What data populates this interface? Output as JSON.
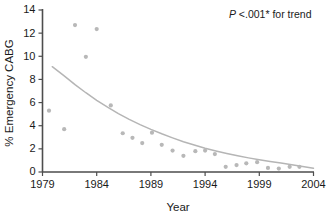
{
  "chart_data": {
    "type": "scatter",
    "title": "",
    "xlabel": "Year",
    "ylabel": "% Emergency CABG",
    "xlim": [
      1979,
      2004
    ],
    "ylim": [
      0,
      14
    ],
    "xticks": [
      1979,
      1984,
      1989,
      1994,
      1999,
      2004
    ],
    "yticks": [
      0,
      2,
      4,
      6,
      8,
      10,
      12,
      14
    ],
    "grid": false,
    "legend": null,
    "annotations": [
      {
        "name": "p-value-trend",
        "text_italic": "P",
        "text": " <.001* for trend",
        "x": 1996.2,
        "y": 13.3
      }
    ],
    "series": [
      {
        "name": "Emergency CABG rate",
        "marker": "circle",
        "color": "#b8b8b8",
        "x": [
          1979.6,
          1981.0,
          1982.0,
          1983.0,
          1984.0,
          1985.3,
          1986.4,
          1987.3,
          1988.2,
          1989.1,
          1990.0,
          1991.0,
          1992.0,
          1993.1,
          1994.0,
          1994.9,
          1995.9,
          1996.9,
          1997.8,
          1998.8,
          1999.8,
          2000.8,
          2001.8,
          2002.7
        ],
        "y": [
          5.3,
          3.7,
          12.7,
          9.95,
          12.35,
          5.75,
          3.35,
          2.95,
          2.5,
          3.4,
          2.35,
          1.85,
          1.4,
          1.8,
          1.85,
          1.55,
          0.45,
          0.6,
          0.75,
          0.85,
          0.35,
          0.3,
          0.45,
          0.45
        ]
      }
    ],
    "trend": {
      "name": "fitted exponential decline",
      "color": "#b5b5b5",
      "x": [
        1979.9,
        1981.0,
        1982.0,
        1983.0,
        1984.0,
        1985.0,
        1986.0,
        1987.0,
        1988.0,
        1989.0,
        1990.0,
        1991.0,
        1992.0,
        1993.0,
        1994.0,
        1995.0,
        1996.0,
        1997.0,
        1998.0,
        1999.0,
        2000.0,
        2001.0,
        2002.0,
        2003.0,
        2004.0
      ],
      "y": [
        9.1,
        8.3,
        7.55,
        6.85,
        6.2,
        5.6,
        5.05,
        4.55,
        4.1,
        3.68,
        3.3,
        2.95,
        2.62,
        2.33,
        2.06,
        1.82,
        1.6,
        1.4,
        1.22,
        1.05,
        0.9,
        0.77,
        0.62,
        0.47,
        0.33
      ]
    }
  }
}
